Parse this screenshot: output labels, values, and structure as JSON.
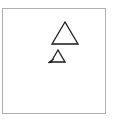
{
  "diagram": {
    "frame": {
      "x": 2,
      "y": 8,
      "w": 103,
      "h": 105,
      "stroke": "#b0b0b0"
    },
    "shapes": [
      {
        "type": "triangle",
        "name": "large-triangle",
        "points": "65,22 52,44 78,44",
        "stroke": "#1a1a1a"
      },
      {
        "type": "triangle",
        "name": "small-triangle",
        "points": "58,50 51,62 65,62",
        "stroke": "#1a1a1a"
      }
    ],
    "arrow": {
      "from": [
        54,
        59
      ],
      "to": [
        48,
        63
      ],
      "color": "#1a1a1a"
    }
  }
}
